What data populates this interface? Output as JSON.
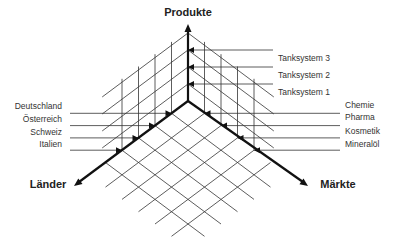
{
  "diagram": {
    "type": "three-axis-market-matrix",
    "axes": {
      "products": {
        "title": "Produkte",
        "items": [
          "Tanksystem 1",
          "Tanksystem 2",
          "Tanksystem 3"
        ]
      },
      "countries": {
        "title": "Länder",
        "items": [
          "Deutschland",
          "Österreich",
          "Schweiz",
          "Italien"
        ]
      },
      "markets": {
        "title": "Märkte",
        "items": [
          "Chemie",
          "Pharma",
          "Kosmetik",
          "Mineralöl"
        ]
      }
    },
    "colors": {
      "lines": "#333333",
      "axes": "#111111",
      "text": "#333333"
    }
  }
}
